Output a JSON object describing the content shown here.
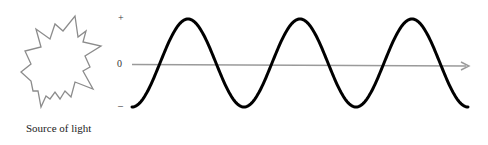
{
  "diagram": {
    "caption": "Source of light",
    "axis": {
      "plus_label": "+",
      "zero_label": "0",
      "minus_label": "–"
    },
    "colors": {
      "wave": "#000000",
      "axis": "#9a9a9a",
      "star_outline": "#8c8c8c",
      "background": "#ffffff"
    },
    "wave": {
      "shape": "sine",
      "cycles_shown": 3,
      "start_phase": "trough",
      "end_phase": "trough"
    },
    "icons": {
      "light_source": "starburst-icon",
      "axis_arrow": "arrow-right-icon"
    }
  }
}
